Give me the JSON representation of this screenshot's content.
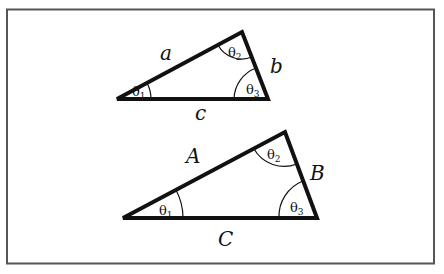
{
  "colors": {
    "background": "#ffffff",
    "frame": "#555555",
    "stroke": "#111111"
  },
  "small_triangle": {
    "vertices": {
      "left": [
        117,
        99
      ],
      "top": [
        242,
        32
      ],
      "right": [
        268,
        99
      ]
    },
    "sides": {
      "a": "a",
      "b": "b",
      "c": "c"
    },
    "angles": {
      "theta1": "θ",
      "theta1_sub": "1",
      "theta2": "θ",
      "theta2_sub": "2",
      "theta3": "θ",
      "theta3_sub": "3"
    }
  },
  "large_triangle": {
    "vertices": {
      "left": [
        123,
        218
      ],
      "top": [
        285,
        132
      ],
      "right": [
        317,
        218
      ]
    },
    "sides": {
      "A": "A",
      "B": "B",
      "C": "C"
    },
    "angles": {
      "theta1": "θ",
      "theta1_sub": "1",
      "theta2": "θ",
      "theta2_sub": "2",
      "theta3": "θ",
      "theta3_sub": "3"
    }
  }
}
